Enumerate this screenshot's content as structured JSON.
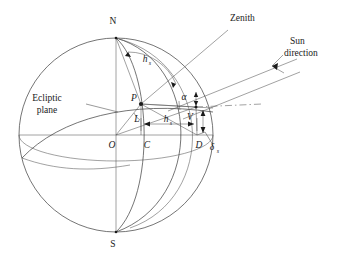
{
  "figure": {
    "type": "geometric-diagram",
    "canvas": {
      "width": 337,
      "height": 255,
      "background": "#ffffff"
    },
    "stroke_color": "#3a3a3a",
    "text_color": "#1a1a1a"
  },
  "sphere": {
    "center": {
      "x": 116,
      "y": 135
    },
    "radius": 97,
    "pole_north": {
      "label": "N",
      "x": 116,
      "y": 38
    },
    "pole_south": {
      "label": "S",
      "x": 116,
      "y": 232
    },
    "origin": {
      "label": "O",
      "x": 116,
      "y": 135
    }
  },
  "labels": {
    "north_pole": "N",
    "south_pole": "S",
    "origin": "O",
    "point_c": "C",
    "point_d": "D",
    "point_p": "P",
    "point_l": "L",
    "point_v": "V",
    "zenith": "Zenith",
    "sun_direction_line1": "Sun",
    "sun_direction_line2": "direction",
    "ecliptic_line1": "Ecliptic",
    "ecliptic_line2": "plane",
    "hour_angle_arc": {
      "symbol": "h",
      "subscript": "s"
    },
    "hour_angle_base": {
      "symbol": "h",
      "subscript": "s"
    },
    "declination": {
      "symbol": "δ",
      "subscript": "s"
    },
    "altitude_angle": {
      "symbol": "α",
      "subscript": ""
    }
  },
  "annotations": [
    {
      "name": "zenith-callout",
      "text": "Zenith",
      "x": 229,
      "y": 24
    },
    {
      "name": "sun-direction-callout",
      "text": "Sun direction",
      "x": 285,
      "y": 46
    },
    {
      "name": "ecliptic-plane-callout",
      "text": "Ecliptic plane",
      "x": 46,
      "y": 100
    },
    {
      "name": "declination-callout",
      "text": "δs",
      "x": 213,
      "y": 148
    },
    {
      "name": "alpha-callout",
      "text": "α",
      "x": 184,
      "y": 97
    }
  ]
}
